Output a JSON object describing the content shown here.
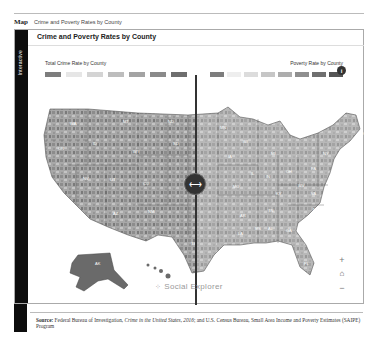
{
  "header": {
    "tag": "Map",
    "subtitle": "Crime and Poverty Rates by County"
  },
  "sidebar": {
    "label": "Interactive"
  },
  "panel": {
    "title": "Crime and Poverty Rates by County"
  },
  "legend_left": {
    "title": "Total Crime Rate by County",
    "swatches": [
      "#7d7d7d",
      "#e6e6e6",
      "#d4d4d4",
      "#bdbdbd",
      "#a3a3a3",
      "#8a8a8a",
      "#6e6e6e"
    ]
  },
  "legend_right": {
    "title": "Poverty Rate by County",
    "swatches": [
      "#7d7d7d",
      "#eeeeee",
      "#dcdcdc",
      "#c6c6c6",
      "#adadad",
      "#8f8f8f",
      "#6f6f6f",
      "#555555"
    ]
  },
  "controls": {
    "swap_icon": "⟷",
    "info_icon": "i",
    "zoom_in": "+",
    "home": "⌂",
    "zoom_out": "−"
  },
  "brand": {
    "icon": "⁘",
    "name": "Social Explorer"
  },
  "map": {
    "states": [
      {
        "abbr": "WA",
        "x": 42,
        "y": 30
      },
      {
        "abbr": "OR",
        "x": 30,
        "y": 55
      },
      {
        "abbr": "ID",
        "x": 65,
        "y": 50
      },
      {
        "abbr": "MT",
        "x": 95,
        "y": 28
      },
      {
        "abbr": "WY",
        "x": 105,
        "y": 58
      },
      {
        "abbr": "NV",
        "x": 55,
        "y": 85
      },
      {
        "abbr": "UT",
        "x": 82,
        "y": 86
      },
      {
        "abbr": "CO",
        "x": 115,
        "y": 90
      },
      {
        "abbr": "AZ",
        "x": 85,
        "y": 120
      },
      {
        "abbr": "NM",
        "x": 120,
        "y": 118
      },
      {
        "abbr": "ND",
        "x": 140,
        "y": 28
      },
      {
        "abbr": "SD",
        "x": 145,
        "y": 50
      },
      {
        "abbr": "TX",
        "x": 163,
        "y": 150
      },
      {
        "abbr": "MN",
        "x": 192,
        "y": 34
      },
      {
        "abbr": "WI",
        "x": 215,
        "y": 48
      },
      {
        "abbr": "IA",
        "x": 200,
        "y": 63
      },
      {
        "abbr": "MI",
        "x": 243,
        "y": 60
      },
      {
        "abbr": "IL",
        "x": 223,
        "y": 80
      },
      {
        "abbr": "IN",
        "x": 238,
        "y": 83
      },
      {
        "abbr": "OH",
        "x": 258,
        "y": 78
      },
      {
        "abbr": "MO",
        "x": 205,
        "y": 93
      },
      {
        "abbr": "KY",
        "x": 248,
        "y": 100
      },
      {
        "abbr": "WV",
        "x": 270,
        "y": 92
      },
      {
        "abbr": "VA",
        "x": 283,
        "y": 100
      },
      {
        "abbr": "PA",
        "x": 283,
        "y": 75
      },
      {
        "abbr": "NY",
        "x": 295,
        "y": 60
      },
      {
        "abbr": "ME",
        "x": 330,
        "y": 40
      },
      {
        "abbr": "TN",
        "x": 240,
        "y": 117
      },
      {
        "abbr": "NC",
        "x": 285,
        "y": 116
      },
      {
        "abbr": "AR",
        "x": 212,
        "y": 122
      },
      {
        "abbr": "MS",
        "x": 227,
        "y": 135
      },
      {
        "abbr": "AL",
        "x": 240,
        "y": 135
      },
      {
        "abbr": "GA",
        "x": 258,
        "y": 137
      },
      {
        "abbr": "LA",
        "x": 210,
        "y": 140
      },
      {
        "abbr": "FL",
        "x": 276,
        "y": 170
      },
      {
        "abbr": "AK",
        "x": 67,
        "y": 170
      }
    ]
  },
  "source": {
    "label": "Source:",
    "text_before": " Federal Bureau of Investigation, ",
    "italic": "Crime in the United States, 2016",
    "text_after": "; and U.S. Census Bureau, Small Area Income and Poverty Estimates (SAIPE) Program"
  }
}
